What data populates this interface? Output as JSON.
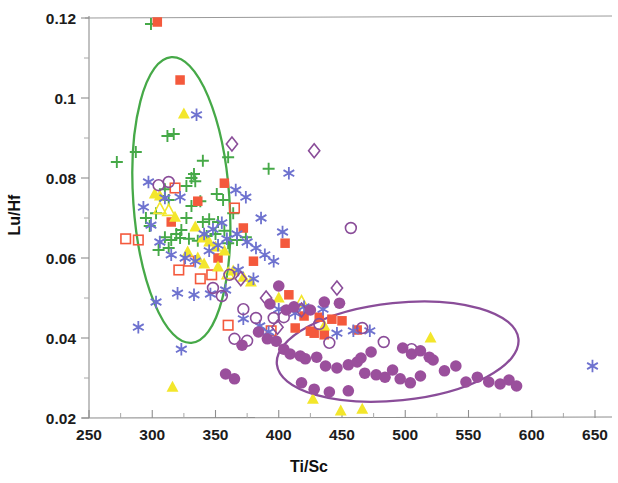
{
  "chart_data": {
    "type": "scatter",
    "title": "",
    "xlabel": "Ti/Sc",
    "ylabel": "Lu/Hf",
    "xlim": [
      237,
      672
    ],
    "ylim": [
      0.0175,
      0.1215
    ],
    "xticks": [
      250,
      300,
      350,
      400,
      450,
      500,
      550,
      600,
      650
    ],
    "yticks": [
      0.02,
      0.04,
      0.06,
      0.08,
      0.1,
      0.12
    ],
    "ytick_labels": [
      "0.02",
      "0.04",
      "0.06",
      "0.08",
      "0.1",
      "0.12"
    ],
    "xtick_labels": [
      "250",
      "300",
      "350",
      "400",
      "450",
      "500",
      "550",
      "600",
      "650"
    ],
    "x_minor_step": 25,
    "y_minor_step": 0.01,
    "grid": false,
    "legend": "none",
    "colors": {
      "green": "#46a948",
      "orange_red": "#f4593c",
      "red_open": "#f4593c",
      "yellow": "#f3e62b",
      "blue": "#6e72cf",
      "purple": "#9a4f9c",
      "purple_ellipse": "#8a4d99",
      "green_ellipse": "#46a948",
      "axis": "#8e8e8e",
      "text": "#161616"
    },
    "annotations": [
      {
        "name": "green-field-ellipse",
        "shape": "ellipse",
        "cx": 323,
        "cy": 0.0745,
        "rx": 38,
        "ry": 0.0358,
        "rotation": -4,
        "stroke": "#46a948",
        "stroke_width": 2.3
      },
      {
        "name": "purple-field-ellipse",
        "shape": "ellipse",
        "cx": 494,
        "cy": 0.0366,
        "rx": 96,
        "ry": 0.0122,
        "rotation": -6,
        "stroke": "#8a4d99",
        "stroke_width": 2.3
      }
    ],
    "series": [
      {
        "name": "green-plus",
        "marker": "plus",
        "color": "#46a948",
        "fill": "none",
        "points": [
          [
            299,
            0.1185
          ],
          [
            287,
            0.0865
          ],
          [
            317,
            0.091
          ],
          [
            312,
            0.0905
          ],
          [
            340,
            0.0843
          ],
          [
            360,
            0.0852
          ],
          [
            272,
            0.084
          ],
          [
            333,
            0.081
          ],
          [
            331,
            0.08
          ],
          [
            334,
            0.0792
          ],
          [
            327,
            0.078
          ],
          [
            310,
            0.0772
          ],
          [
            392,
            0.0823
          ],
          [
            351,
            0.076
          ],
          [
            356,
            0.0745
          ],
          [
            306,
            0.0755
          ],
          [
            313,
            0.0745
          ],
          [
            338,
            0.0742
          ],
          [
            331,
            0.073
          ],
          [
            303,
            0.0712
          ],
          [
            327,
            0.07
          ],
          [
            345,
            0.0697
          ],
          [
            352,
            0.069
          ],
          [
            364,
            0.0712
          ],
          [
            298,
            0.068
          ],
          [
            319,
            0.066
          ],
          [
            310,
            0.0652
          ],
          [
            315,
            0.0645
          ],
          [
            322,
            0.065
          ],
          [
            329,
            0.0648
          ],
          [
            336,
            0.0643
          ],
          [
            343,
            0.0655
          ],
          [
            350,
            0.066
          ],
          [
            357,
            0.0668
          ],
          [
            313,
            0.0625
          ],
          [
            305,
            0.062
          ],
          [
            360,
            0.0637
          ],
          [
            367,
            0.0645
          ],
          [
            374,
            0.0652
          ],
          [
            340,
            0.069
          ],
          [
            295,
            0.07
          ],
          [
            323,
            0.067
          ]
        ]
      },
      {
        "name": "orange-filled-square",
        "marker": "square-filled",
        "color": "#f4593c",
        "fill": "#f4593c",
        "points": [
          [
            304,
            0.119
          ],
          [
            322,
            0.1045
          ],
          [
            357,
            0.0787
          ],
          [
            336,
            0.0742
          ],
          [
            315,
            0.069
          ],
          [
            372,
            0.0675
          ],
          [
            405,
            0.0637
          ],
          [
            352,
            0.06
          ],
          [
            380,
            0.0592
          ],
          [
            408,
            0.0508
          ],
          [
            420,
            0.0455
          ],
          [
            432,
            0.0452
          ],
          [
            442,
            0.0447
          ],
          [
            450,
            0.0443
          ],
          [
            462,
            0.042
          ],
          [
            413,
            0.0425
          ],
          [
            428,
            0.0412
          ],
          [
            436,
            0.0408
          ],
          [
            425,
            0.0417
          ]
        ]
      },
      {
        "name": "red-open-square",
        "marker": "square-open",
        "color": "#f4593c",
        "fill": "none",
        "points": [
          [
            318,
            0.0775
          ],
          [
            365,
            0.0725
          ],
          [
            279,
            0.0648
          ],
          [
            289,
            0.0645
          ],
          [
            329,
            0.0592
          ],
          [
            338,
            0.0548
          ],
          [
            321,
            0.057
          ],
          [
            394,
            0.0418
          ],
          [
            360,
            0.0432
          ],
          [
            347,
            0.0558
          ]
        ]
      },
      {
        "name": "yellow-filled-triangle",
        "marker": "triangle-filled",
        "color": "#f3e62b",
        "fill": "#f3e62b",
        "points": [
          [
            325,
            0.096
          ],
          [
            302,
            0.076
          ],
          [
            306,
            0.0755
          ],
          [
            318,
            0.0702
          ],
          [
            334,
            0.0678
          ],
          [
            340,
            0.065
          ],
          [
            345,
            0.064
          ],
          [
            350,
            0.0628
          ],
          [
            357,
            0.0618
          ],
          [
            328,
            0.0615
          ],
          [
            336,
            0.06
          ],
          [
            341,
            0.0585
          ],
          [
            352,
            0.0578
          ],
          [
            364,
            0.0568
          ],
          [
            372,
            0.0552
          ],
          [
            378,
            0.054
          ],
          [
            316,
            0.0277
          ],
          [
            427,
            0.0247
          ],
          [
            449,
            0.0218
          ],
          [
            466,
            0.0222
          ],
          [
            520,
            0.04
          ],
          [
            436,
            0.043
          ],
          [
            400,
            0.05
          ]
        ]
      },
      {
        "name": "yellow-open-triangle",
        "marker": "triangle-open",
        "color": "#f3e62b",
        "fill": "none",
        "points": [
          [
            306,
            0.0723
          ],
          [
            313,
            0.0718
          ],
          [
            418,
            0.049
          ],
          [
            360,
            0.056
          ]
        ]
      },
      {
        "name": "blue-asterisk",
        "marker": "asterisk",
        "color": "#6e72cf",
        "fill": "none",
        "points": [
          [
            335,
            0.0958
          ],
          [
            408,
            0.0812
          ],
          [
            297,
            0.079
          ],
          [
            293,
            0.0727
          ],
          [
            310,
            0.075
          ],
          [
            322,
            0.0752
          ],
          [
            366,
            0.077
          ],
          [
            374,
            0.0752
          ],
          [
            386,
            0.07
          ],
          [
            403,
            0.0665
          ],
          [
            355,
            0.0688
          ],
          [
            348,
            0.0672
          ],
          [
            341,
            0.066
          ],
          [
            299,
            0.0682
          ],
          [
            306,
            0.064
          ],
          [
            315,
            0.0608
          ],
          [
            326,
            0.06
          ],
          [
            334,
            0.0592
          ],
          [
            345,
            0.0618
          ],
          [
            352,
            0.0632
          ],
          [
            359,
            0.0648
          ],
          [
            367,
            0.066
          ],
          [
            375,
            0.064
          ],
          [
            382,
            0.0625
          ],
          [
            389,
            0.0608
          ],
          [
            396,
            0.0592
          ],
          [
            358,
            0.052
          ],
          [
            346,
            0.051
          ],
          [
            333,
            0.0508
          ],
          [
            320,
            0.0512
          ],
          [
            303,
            0.049
          ],
          [
            289,
            0.0427
          ],
          [
            323,
            0.0372
          ],
          [
            372,
            0.0448
          ],
          [
            385,
            0.043
          ],
          [
            392,
            0.0415
          ],
          [
            400,
            0.0472
          ],
          [
            413,
            0.0462
          ],
          [
            420,
            0.0478
          ],
          [
            435,
            0.0472
          ],
          [
            446,
            0.0412
          ],
          [
            472,
            0.0418
          ],
          [
            459,
            0.0418
          ],
          [
            648,
            0.033
          ],
          [
            368,
            0.057
          ],
          [
            380,
            0.0548
          ]
        ]
      },
      {
        "name": "purple-open-diamond",
        "marker": "diamond-open",
        "color": "#8a4d99",
        "fill": "none",
        "points": [
          [
            363,
            0.0885
          ],
          [
            428,
            0.0868
          ],
          [
            370,
            0.0548
          ],
          [
            446,
            0.0525
          ],
          [
            418,
            0.047
          ],
          [
            399,
            0.0427
          ],
          [
            390,
            0.05
          ]
        ]
      },
      {
        "name": "purple-open-circle",
        "marker": "circle-open",
        "color": "#8a4d99",
        "fill": "none",
        "points": [
          [
            313,
            0.079
          ],
          [
            305,
            0.0782
          ],
          [
            457,
            0.0675
          ],
          [
            361,
            0.0558
          ],
          [
            348,
            0.0525
          ],
          [
            355,
            0.0505
          ],
          [
            372,
            0.0472
          ],
          [
            382,
            0.045
          ],
          [
            396,
            0.045
          ],
          [
            404,
            0.0452
          ],
          [
            365,
            0.0398
          ],
          [
            375,
            0.0393
          ],
          [
            432,
            0.0435
          ],
          [
            466,
            0.0425
          ],
          [
            483,
            0.039
          ],
          [
            440,
            0.0388
          ],
          [
            505,
            0.0372
          ]
        ]
      },
      {
        "name": "purple-filled-circle",
        "marker": "circle-filled",
        "color": "#9a4f9c",
        "fill": "#9a4f9c",
        "points": [
          [
            400,
            0.053
          ],
          [
            393,
            0.0485
          ],
          [
            371,
            0.0382
          ],
          [
            406,
            0.047
          ],
          [
            412,
            0.0478
          ],
          [
            425,
            0.047
          ],
          [
            436,
            0.049
          ],
          [
            448,
            0.0487
          ],
          [
            384,
            0.0415
          ],
          [
            391,
            0.0398
          ],
          [
            398,
            0.0392
          ],
          [
            404,
            0.0372
          ],
          [
            409,
            0.036
          ],
          [
            417,
            0.0355
          ],
          [
            421,
            0.0348
          ],
          [
            430,
            0.0352
          ],
          [
            437,
            0.033
          ],
          [
            446,
            0.0325
          ],
          [
            455,
            0.0333
          ],
          [
            462,
            0.034
          ],
          [
            468,
            0.0312
          ],
          [
            477,
            0.0308
          ],
          [
            484,
            0.0302
          ],
          [
            490,
            0.032
          ],
          [
            498,
            0.0375
          ],
          [
            505,
            0.036
          ],
          [
            512,
            0.0368
          ],
          [
            519,
            0.0352
          ],
          [
            496,
            0.0298
          ],
          [
            504,
            0.0288
          ],
          [
            512,
            0.0305
          ],
          [
            522,
            0.0345
          ],
          [
            531,
            0.0318
          ],
          [
            540,
            0.033
          ],
          [
            548,
            0.029
          ],
          [
            557,
            0.0302
          ],
          [
            566,
            0.029
          ],
          [
            575,
            0.0285
          ],
          [
            582,
            0.0295
          ],
          [
            588,
            0.028
          ],
          [
            455,
            0.0268
          ],
          [
            440,
            0.0265
          ],
          [
            428,
            0.0272
          ],
          [
            418,
            0.0288
          ],
          [
            465,
            0.035
          ],
          [
            473,
            0.0365
          ],
          [
            358,
            0.031
          ],
          [
            365,
            0.0298
          ]
        ]
      }
    ]
  }
}
